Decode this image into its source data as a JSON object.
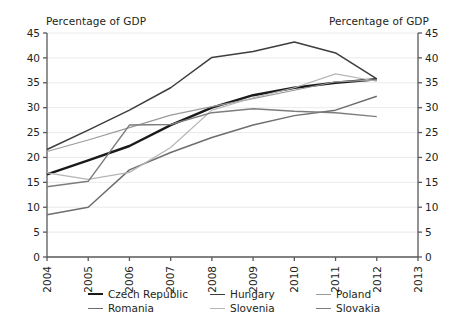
{
  "chart_data": {
    "type": "line",
    "title": "",
    "left_axis_title": "Percentage of GDP",
    "right_axis_title": "Percentage of GDP",
    "xlabel": "",
    "ylabel": "Percentage of GDP",
    "x": [
      2004,
      2005,
      2006,
      2007,
      2008,
      2009,
      2010,
      2011,
      2012,
      2013
    ],
    "xtick_labels": [
      "2004",
      "2005",
      "2006",
      "2007",
      "2008",
      "2009",
      "2010",
      "2011",
      "2012",
      "2013"
    ],
    "ylim": [
      0,
      45
    ],
    "ytick_labels": [
      "0",
      "5",
      "10",
      "15",
      "20",
      "25",
      "30",
      "35",
      "40",
      "45"
    ],
    "yticks": [
      0,
      5,
      10,
      15,
      20,
      25,
      30,
      35,
      40,
      45
    ],
    "grid": true,
    "dual_axis": true,
    "legend_position": "bottom",
    "series": [
      {
        "name": "Czech Republic",
        "color": "#1a1a1a",
        "width": 2.4,
        "x": [
          2004,
          2005,
          2006,
          2007,
          2008,
          2009,
          2010,
          2011,
          2012
        ],
        "values": [
          16.6,
          19.4,
          22.3,
          26.5,
          30.0,
          32.5,
          34.0,
          35.0,
          35.7
        ]
      },
      {
        "name": "Hungary",
        "color": "#3d3d3d",
        "width": 1.5,
        "x": [
          2004,
          2005,
          2006,
          2007,
          2008,
          2009,
          2010,
          2011,
          2012
        ],
        "values": [
          21.6,
          25.5,
          29.5,
          34.0,
          40.1,
          41.3,
          43.2,
          41.0,
          35.8
        ]
      },
      {
        "name": "Poland",
        "color": "#9a9a9a",
        "width": 1.2,
        "x": [
          2004,
          2005,
          2006,
          2007,
          2008,
          2009,
          2010,
          2011,
          2012
        ],
        "values": [
          21.2,
          23.5,
          26.0,
          28.5,
          30.2,
          31.8,
          33.5,
          35.2,
          35.6
        ]
      },
      {
        "name": "Romania",
        "color": "#6e6e6e",
        "width": 1.5,
        "x": [
          2004,
          2005,
          2006,
          2007,
          2008,
          2009,
          2010,
          2011,
          2012
        ],
        "values": [
          8.5,
          10.0,
          17.5,
          21.0,
          24.0,
          26.5,
          28.4,
          29.5,
          32.3
        ]
      },
      {
        "name": "Slovenia",
        "color": "#b5b5b5",
        "width": 1.2,
        "x": [
          2004,
          2005,
          2006,
          2007,
          2008,
          2009,
          2010,
          2011,
          2012
        ],
        "values": [
          16.9,
          15.6,
          17.0,
          22.0,
          29.5,
          32.0,
          34.0,
          36.8,
          35.3
        ]
      },
      {
        "name": "Slovakia",
        "color": "#7d7d7d",
        "width": 1.5,
        "x": [
          2004,
          2005,
          2006,
          2007,
          2008,
          2009,
          2010,
          2011,
          2012
        ],
        "values": [
          14.1,
          15.2,
          26.5,
          26.6,
          29.0,
          29.8,
          29.3,
          29.0,
          28.2
        ]
      }
    ]
  },
  "legend": {
    "rows": [
      [
        {
          "label": "Czech Republic",
          "color": "#1a1a1a",
          "width": 2.6
        },
        {
          "label": "Hungary",
          "color": "#3d3d3d",
          "width": 1.8
        },
        {
          "label": "Poland",
          "color": "#9a9a9a",
          "width": 1.4
        }
      ],
      [
        {
          "label": "Romania",
          "color": "#6e6e6e",
          "width": 1.8
        },
        {
          "label": "Slovenia",
          "color": "#b5b5b5",
          "width": 1.4
        },
        {
          "label": "Slovakia",
          "color": "#7d7d7d",
          "width": 1.8
        }
      ]
    ]
  },
  "colors": {
    "axis": "#58595b",
    "grid": "#eceaea",
    "text": "#231f20",
    "background": "#ffffff"
  }
}
